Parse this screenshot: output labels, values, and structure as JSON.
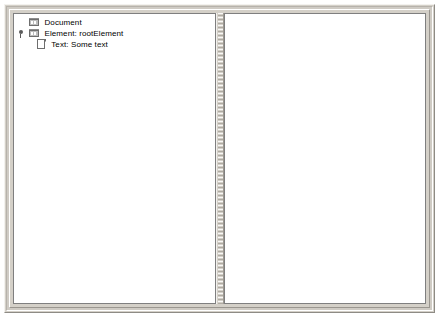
{
  "window": {
    "frame_background": "#d4d0c8",
    "pane_background": "#ffffff",
    "border_color": "#7f7f7f"
  },
  "split_pane": {
    "orientation": "horizontal",
    "divider_position_px": 203,
    "divider_width_px": 8
  },
  "tree": {
    "nodes": [
      {
        "label": "Document",
        "depth": 0,
        "icon": "document-node-icon",
        "expanded": false,
        "has_handle": false
      },
      {
        "label": "Element: rootElement",
        "depth": 1,
        "icon": "element-node-icon",
        "expanded": true,
        "has_handle": true
      },
      {
        "label": "Text: Some text",
        "depth": 2,
        "icon": "text-leaf-icon",
        "expanded": false,
        "has_handle": false
      }
    ]
  },
  "right_pane": {
    "content": ""
  }
}
